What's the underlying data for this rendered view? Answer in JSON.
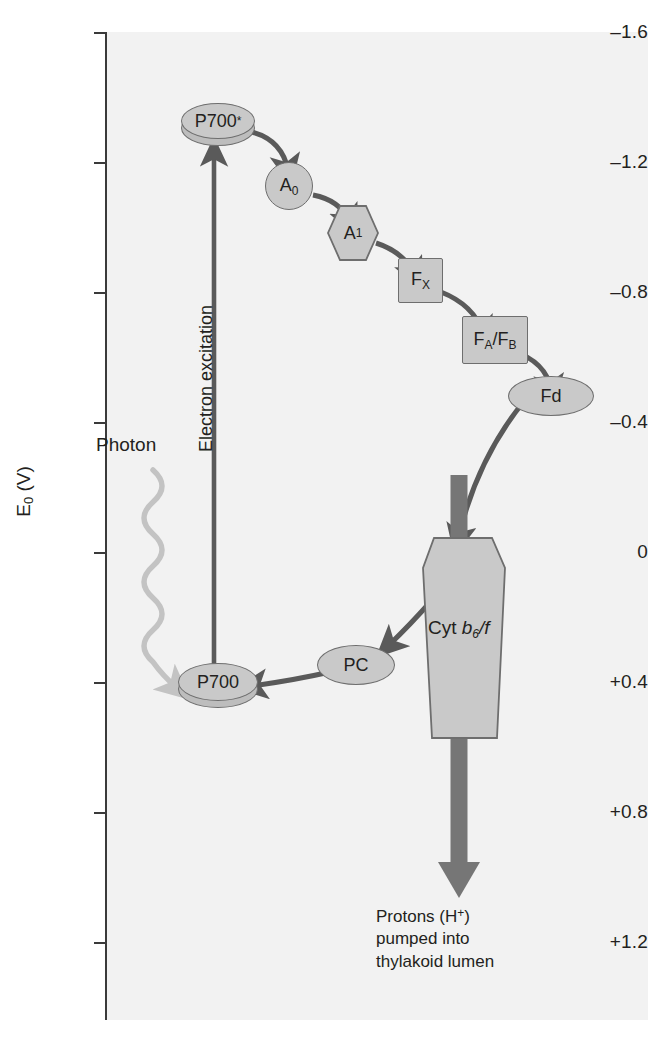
{
  "figure": {
    "type": "diagram",
    "yaxis": {
      "title_main": "E",
      "title_sub": "0",
      "title_unit": " (V)",
      "ticks": [
        "–1.6",
        "–1.2",
        "–0.8",
        "–0.4",
        "0",
        "+0.4",
        "+0.8",
        "+1.2"
      ],
      "tick_values": [
        -1.6,
        -1.2,
        -0.8,
        -0.4,
        0,
        0.4,
        0.8,
        1.2
      ]
    },
    "nodes": [
      {
        "id": "p700star",
        "label_main": "P700",
        "label_sup": "*",
        "shape": "disc",
        "potential": -1.3
      },
      {
        "id": "a0",
        "label_main": "A",
        "label_sub": "0",
        "shape": "circle",
        "potential": -1.15
      },
      {
        "id": "a1",
        "label_main": "A",
        "label_sub": "1",
        "shape": "hexagon",
        "potential": -1.0
      },
      {
        "id": "fx",
        "label_main": "F",
        "label_sub": "X",
        "shape": "square",
        "potential": -0.82
      },
      {
        "id": "fafb",
        "label_main": "F",
        "label_sub": "A",
        "label_mid": "/F",
        "label_sub2": "B",
        "shape": "rect",
        "potential": -0.62
      },
      {
        "id": "fd",
        "label_main": "Fd",
        "shape": "ellipse",
        "potential": -0.43
      },
      {
        "id": "cyt",
        "label_main": "Cyt ",
        "label_italic": "b",
        "label_sub": "6",
        "label_italic2": "/f",
        "shape": "hexagon-tall",
        "potential": 0.1
      },
      {
        "id": "pc",
        "label_main": "PC",
        "shape": "ellipse",
        "potential": 0.37
      },
      {
        "id": "p700",
        "label_main": "P700",
        "shape": "disc",
        "potential": 0.4
      }
    ],
    "annotations": {
      "electron_excitation": "Electron excitation",
      "photon": "Photon",
      "protons_line1": "Protons (H",
      "protons_sup": "+",
      "protons_line1_end": ")",
      "protons_line2": "pumped into",
      "protons_line3": "thylakoid lumen"
    },
    "colors": {
      "node_fill": "#c9c9c9",
      "node_stroke": "#6e6e6e",
      "arrow": "#5a5a5a",
      "proton_arrow": "#767676",
      "photon_arrow": "#c3c3c3",
      "plot_bg": "#f2f2f2",
      "text": "#231f20"
    }
  }
}
